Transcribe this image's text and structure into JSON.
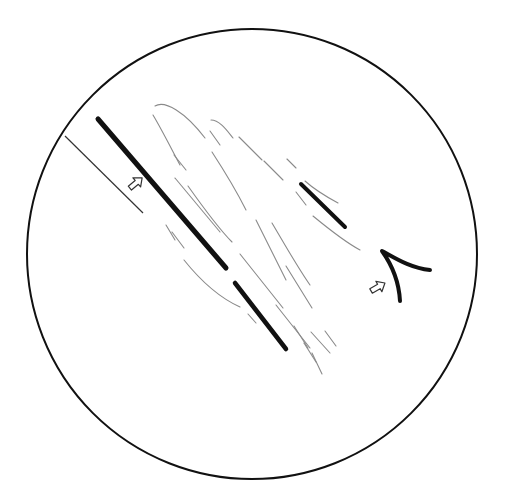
{
  "figure": {
    "colors": {
      "background": "#ffffff",
      "stroke": "#111111",
      "faint": "#8a8a8a"
    },
    "field_circle": {
      "cx": 252,
      "cy": 254,
      "r": 225
    },
    "pointer_line": {
      "x1": 65,
      "y1": 136,
      "x2": 143,
      "y2": 213
    },
    "thick_lines": [
      {
        "x1": 98,
        "y1": 119,
        "x2": 226,
        "y2": 268,
        "w": 5
      },
      {
        "x1": 235,
        "y1": 283,
        "x2": 286,
        "y2": 349,
        "w": 4.5
      },
      {
        "x1": 301,
        "y1": 184,
        "x2": 345,
        "y2": 227,
        "w": 4
      }
    ],
    "caret": {
      "tip": [
        382,
        251
      ],
      "arm1": [
        430,
        270
      ],
      "arm2": [
        400,
        301
      ]
    },
    "arrows": [
      {
        "x": 136,
        "y": 183,
        "label": "arrow-indicator-1"
      },
      {
        "x": 378,
        "y": 287,
        "label": "arrow-indicator-2"
      }
    ]
  }
}
